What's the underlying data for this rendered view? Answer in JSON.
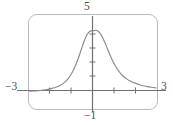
{
  "figure": {
    "name": "graphing-calculator-plot",
    "frame_color": "#b9b9bd",
    "axis_color": "#6f6f74",
    "curve_color": "#8a8a90",
    "text_color": "#4d4d4d"
  },
  "labels": {
    "ymax": "5",
    "ymin": "−1",
    "xmin": "−3",
    "xmax": "3"
  },
  "chart_data": {
    "type": "line",
    "title": "",
    "xlabel": "",
    "ylabel": "",
    "xlim": [
      -3,
      3
    ],
    "ylim": [
      -1,
      5
    ],
    "grid": false,
    "legend": "none",
    "xticks": [
      -2,
      -1,
      1,
      2
    ],
    "yticks": [
      1,
      2,
      3,
      4
    ],
    "xtick_labels": [
      "−3",
      "3"
    ],
    "ytick_labels": [
      "5",
      "−1"
    ],
    "annotations": [
      "peak near x = 0.15, y ≈ 4.05"
    ],
    "series": [
      {
        "name": "bell curve",
        "x": [
          -3,
          -2.8,
          -2.6,
          -2.4,
          -2.2,
          -2,
          -1.8,
          -1.6,
          -1.4,
          -1.2,
          -1,
          -0.9,
          -0.8,
          -0.7,
          -0.6,
          -0.5,
          -0.4,
          -0.3,
          -0.2,
          -0.1,
          0,
          0.05,
          0.15,
          0.25,
          0.35,
          0.45,
          0.55,
          0.7,
          0.85,
          1,
          1.2,
          1.4,
          1.6,
          1.8,
          2,
          2.2,
          2.4,
          2.6,
          2.8,
          3
        ],
        "y": [
          0.1,
          0.11,
          0.13,
          0.16,
          0.2,
          0.26,
          0.34,
          0.45,
          0.62,
          0.88,
          1.3,
          1.57,
          1.88,
          2.24,
          2.64,
          3.05,
          3.43,
          3.74,
          3.94,
          4.03,
          4.05,
          4.05,
          4.06,
          4.0,
          3.85,
          3.62,
          3.32,
          2.82,
          2.32,
          1.9,
          1.45,
          1.12,
          0.9,
          0.74,
          0.62,
          0.53,
          0.45,
          0.39,
          0.35,
          0.31
        ]
      }
    ]
  }
}
